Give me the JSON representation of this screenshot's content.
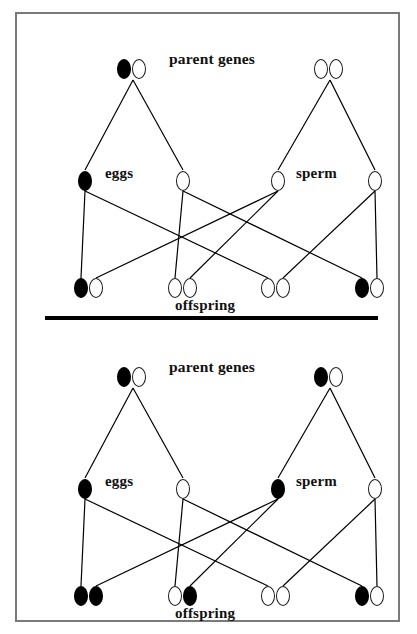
{
  "figure": {
    "type": "genetics-inheritance-diagram",
    "panels": [
      {
        "id": "panel-top",
        "name": "cross-heterozygous-by-homozygous-recessive",
        "labels": {
          "parent_genes": "parent genes",
          "eggs": "eggs",
          "sperm": "sperm",
          "offspring": "offspring"
        },
        "parents": [
          {
            "name": "mother",
            "alleles": [
              "filled",
              "open"
            ],
            "x": 100,
            "y": 45
          },
          {
            "name": "father",
            "alleles": [
              "open",
              "open"
            ],
            "x": 297,
            "y": 45
          }
        ],
        "gametes": [
          {
            "name": "egg-1",
            "group": "eggs",
            "allele": "filled",
            "x": 61,
            "y": 157
          },
          {
            "name": "egg-2",
            "group": "eggs",
            "allele": "open",
            "x": 159,
            "y": 157
          },
          {
            "name": "sperm-1",
            "group": "sperm",
            "allele": "open",
            "x": 254,
            "y": 157
          },
          {
            "name": "sperm-2",
            "group": "sperm",
            "allele": "open",
            "x": 351,
            "y": 157
          }
        ],
        "offspring": [
          {
            "name": "offspring-1",
            "alleles": [
              "filled",
              "open"
            ],
            "x": 57,
            "y": 264
          },
          {
            "name": "offspring-2",
            "alleles": [
              "open",
              "open"
            ],
            "x": 151,
            "y": 264
          },
          {
            "name": "offspring-3",
            "alleles": [
              "open",
              "open"
            ],
            "x": 244,
            "y": 264
          },
          {
            "name": "offspring-4",
            "alleles": [
              "filled",
              "open"
            ],
            "x": 338,
            "y": 264
          }
        ]
      },
      {
        "id": "panel-bottom",
        "name": "cross-heterozygous-by-heterozygous",
        "labels": {
          "parent_genes": "parent genes",
          "eggs": "eggs",
          "sperm": "sperm",
          "offspring": "offspring"
        },
        "parents": [
          {
            "name": "mother",
            "alleles": [
              "filled",
              "open"
            ],
            "x": 100,
            "y": 45
          },
          {
            "name": "father",
            "alleles": [
              "filled",
              "open"
            ],
            "x": 297,
            "y": 45
          }
        ],
        "gametes": [
          {
            "name": "egg-1",
            "group": "eggs",
            "allele": "filled",
            "x": 61,
            "y": 157
          },
          {
            "name": "egg-2",
            "group": "eggs",
            "allele": "open",
            "x": 159,
            "y": 157
          },
          {
            "name": "sperm-1",
            "group": "sperm",
            "allele": "filled",
            "x": 254,
            "y": 157
          },
          {
            "name": "sperm-2",
            "group": "sperm",
            "allele": "open",
            "x": 351,
            "y": 157
          }
        ],
        "offspring": [
          {
            "name": "offspring-1",
            "alleles": [
              "filled",
              "filled"
            ],
            "x": 57,
            "y": 264
          },
          {
            "name": "offspring-2",
            "alleles": [
              "open",
              "filled"
            ],
            "x": 151,
            "y": 264
          },
          {
            "name": "offspring-3",
            "alleles": [
              "open",
              "open"
            ],
            "x": 244,
            "y": 264
          },
          {
            "name": "offspring-4",
            "alleles": [
              "filled",
              "open"
            ],
            "x": 338,
            "y": 264
          }
        ]
      }
    ],
    "label_positions": {
      "parent_genes": {
        "x": 152,
        "y": 36
      },
      "eggs": {
        "x": 88,
        "y": 151
      },
      "sperm": {
        "x": 279,
        "y": 151
      },
      "offspring": {
        "x": 158,
        "y": 283
      }
    },
    "meiosis_edges": [
      {
        "from": "mother",
        "to": "egg-1"
      },
      {
        "from": "mother",
        "to": "egg-2"
      },
      {
        "from": "father",
        "to": "sperm-1"
      },
      {
        "from": "father",
        "to": "sperm-2"
      }
    ],
    "fertilization_edges": [
      {
        "from": "egg-1",
        "to": "offspring-1"
      },
      {
        "from": "egg-1",
        "to": "offspring-3"
      },
      {
        "from": "egg-2",
        "to": "offspring-2"
      },
      {
        "from": "egg-2",
        "to": "offspring-4"
      },
      {
        "from": "sperm-1",
        "to": "offspring-1"
      },
      {
        "from": "sperm-1",
        "to": "offspring-2"
      },
      {
        "from": "sperm-2",
        "to": "offspring-3"
      },
      {
        "from": "sperm-2",
        "to": "offspring-4"
      }
    ],
    "colors": {
      "ink": "#000000",
      "border": "#7a7a7a",
      "background": "#ffffff"
    }
  }
}
